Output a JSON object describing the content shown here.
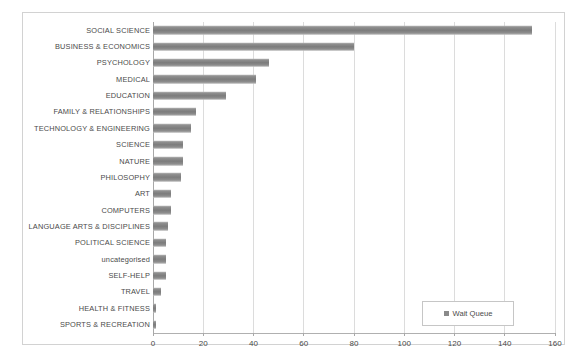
{
  "chart_data": {
    "type": "bar",
    "orientation": "horizontal",
    "title": "",
    "xlabel": "",
    "ylabel": "",
    "xlim": [
      0,
      160
    ],
    "xticks": [
      0,
      20,
      40,
      60,
      80,
      100,
      120,
      140,
      160
    ],
    "grid": true,
    "legend": {
      "position": "inside-bottom-right",
      "entries": [
        {
          "label": "Wait Queue",
          "color": "#8a8a8a",
          "marker": "square"
        }
      ]
    },
    "series": [
      {
        "name": "Wait Queue",
        "color": "#8a8a8a"
      }
    ],
    "categories": [
      "SOCIAL SCIENCE",
      "BUSINESS & ECONOMICS",
      "PSYCHOLOGY",
      "MEDICAL",
      "EDUCATION",
      "FAMILY & RELATIONSHIPS",
      "TECHNOLOGY & ENGINEERING",
      "SCIENCE",
      "NATURE",
      "PHILOSOPHY",
      "ART",
      "COMPUTERS",
      "LANGUAGE ARTS & DISCIPLINES",
      "POLITICAL SCIENCE",
      "uncategorised",
      "SELF-HELP",
      "TRAVEL",
      "HEALTH & FITNESS",
      "SPORTS & RECREATION"
    ],
    "values": [
      151,
      80,
      46,
      41,
      29,
      17,
      15,
      12,
      12,
      11,
      7,
      7,
      6,
      5,
      5,
      5,
      3,
      1,
      1
    ]
  }
}
